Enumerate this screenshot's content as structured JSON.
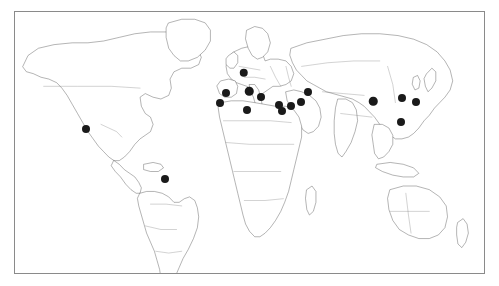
{
  "figure": {
    "kind": "world-map",
    "frame": {
      "border_color": "#8a8a8a",
      "background_color": "#ffffff",
      "left": 14,
      "top": 11,
      "width": 471,
      "height": 263
    },
    "projection": "equirectangular",
    "lon_range": [
      -180,
      180
    ],
    "lat_range": [
      -60,
      84
    ]
  },
  "map_style": {
    "land_fill": "#ffffff",
    "coastline_color": "#3a3a3a",
    "country_border_color": "#6b6b6b",
    "marker_color": "#1a1a1a",
    "marker_diameter_px": 8
  },
  "markers": {
    "count": 17,
    "legend_label": "Study site",
    "points": [
      {
        "name": "mexico-site",
        "region": "North America",
        "x_pct": 15.1,
        "y_pct": 44.9,
        "size": 8
      },
      {
        "name": "brazil-site",
        "region": "South America",
        "x_pct": 32.0,
        "y_pct": 63.9,
        "size": 8
      },
      {
        "name": "denmark-site",
        "region": "Northern Europe",
        "x_pct": 48.8,
        "y_pct": 23.2,
        "size": 8.5
      },
      {
        "name": "spain-site",
        "region": "Iberia",
        "x_pct": 45.0,
        "y_pct": 31.2,
        "size": 8
      },
      {
        "name": "italy-site",
        "region": "Southern Europe",
        "x_pct": 49.9,
        "y_pct": 30.4,
        "size": 8.5
      },
      {
        "name": "greece-site",
        "region": "Southeast Europe",
        "x_pct": 52.4,
        "y_pct": 32.7,
        "size": 8
      },
      {
        "name": "morocco-site",
        "region": "North Africa",
        "x_pct": 43.7,
        "y_pct": 35.0,
        "size": 8
      },
      {
        "name": "algeria-tunisia-site",
        "region": "North Africa",
        "x_pct": 49.5,
        "y_pct": 37.6,
        "size": 8
      },
      {
        "name": "israel-levant-site",
        "region": "Middle East",
        "x_pct": 56.3,
        "y_pct": 35.7,
        "size": 8
      },
      {
        "name": "egypt-site",
        "region": "North Africa",
        "x_pct": 56.9,
        "y_pct": 38.0,
        "size": 8
      },
      {
        "name": "iraq-site",
        "region": "Middle East",
        "x_pct": 58.9,
        "y_pct": 36.1,
        "size": 8
      },
      {
        "name": "iran-site",
        "region": "Middle East",
        "x_pct": 60.9,
        "y_pct": 34.6,
        "size": 8
      },
      {
        "name": "caspian-caucasus-site",
        "region": "Western Asia",
        "x_pct": 62.4,
        "y_pct": 30.5,
        "size": 8
      },
      {
        "name": "china-central-site",
        "region": "East Asia",
        "x_pct": 76.4,
        "y_pct": 34.2,
        "size": 8.5
      },
      {
        "name": "korea-site",
        "region": "East Asia",
        "x_pct": 82.6,
        "y_pct": 33.1,
        "size": 8
      },
      {
        "name": "japan-site",
        "region": "East Asia",
        "x_pct": 85.6,
        "y_pct": 34.3,
        "size": 8
      },
      {
        "name": "south-china-site",
        "region": "East Asia",
        "x_pct": 82.4,
        "y_pct": 42.0,
        "size": 8
      }
    ]
  }
}
